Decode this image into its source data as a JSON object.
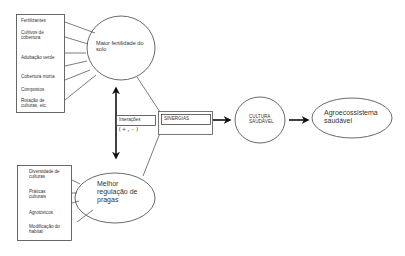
{
  "top_box": {
    "items": [
      "Fertilizantes",
      "Cultivos de cobertura",
      "Adubação verde",
      "Cobertura morta",
      "Compostos",
      "Rotação de culturas, etc."
    ]
  },
  "top_ellipse": {
    "label": "Maior fertilidade do solo"
  },
  "interactions": {
    "label": "Interações",
    "sign": "(+,-)"
  },
  "synergy": {
    "label": "SINERGIAS"
  },
  "culture_ellipse": {
    "label": "CULTURA SAUDÁVEL"
  },
  "agro_ellipse": {
    "label": "Agroecossistema saudável"
  },
  "bottom_box": {
    "items": [
      "Diversidade de culturas",
      "Práticas culturais",
      "Agrotóxicos",
      "Modificação do habitat"
    ]
  },
  "bottom_ellipse": {
    "label": "Melhor regulação de pragas"
  },
  "colors": {
    "stroke": "#333333",
    "background": "#ffffff"
  }
}
